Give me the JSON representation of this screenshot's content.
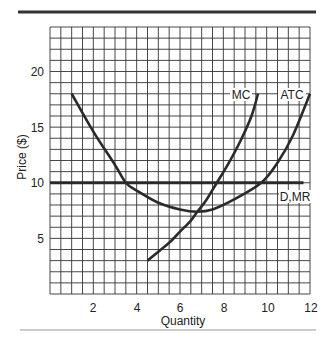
{
  "chart_data": {
    "type": "line",
    "title": "",
    "xlabel": "Quantity",
    "ylabel": "Price ($)",
    "xlim": [
      0,
      12
    ],
    "ylim": [
      0,
      24
    ],
    "grid": true,
    "grid_step": {
      "x": 0.5,
      "y": 1
    },
    "x_ticks": [
      2,
      4,
      6,
      8,
      10,
      12
    ],
    "y_ticks": [
      5,
      10,
      15,
      20
    ],
    "series": [
      {
        "name": "ATC",
        "x": [
          1.0,
          2.0,
          3.0,
          3.5,
          4.0,
          5.0,
          6.0,
          6.8,
          7.5,
          8.5,
          9.75,
          10.5,
          11.2,
          12.0
        ],
        "values": [
          18.0,
          14.6,
          11.6,
          10.0,
          9.3,
          8.2,
          7.6,
          7.4,
          7.6,
          8.5,
          10.0,
          11.8,
          14.2,
          18.0
        ]
      },
      {
        "name": "MC",
        "x": [
          4.5,
          5.0,
          5.5,
          6.0,
          6.5,
          6.8,
          7.2,
          7.7,
          8.2,
          8.8,
          9.3,
          9.6
        ],
        "values": [
          3.0,
          3.8,
          4.6,
          5.6,
          6.6,
          7.4,
          8.4,
          10.0,
          11.6,
          13.8,
          16.0,
          18.0
        ]
      },
      {
        "name": "D,MR",
        "x": [
          0,
          11.7
        ],
        "values": [
          10,
          10
        ]
      }
    ],
    "annotations": [
      {
        "text": "MC",
        "x": 9.6,
        "y": 18
      },
      {
        "text": "ATC",
        "x": 12,
        "y": 18
      },
      {
        "text": "D,MR",
        "x": 11.7,
        "y": 8.9
      }
    ]
  },
  "labels": {
    "xlabel": "Quantity",
    "ylabel": "Price ($)",
    "x_ticks": [
      "2",
      "4",
      "6",
      "8",
      "10",
      "12"
    ],
    "y_ticks": [
      "5",
      "10",
      "15",
      "20"
    ],
    "mc": "MC",
    "atc": "ATC",
    "dmr": "D,MR"
  }
}
